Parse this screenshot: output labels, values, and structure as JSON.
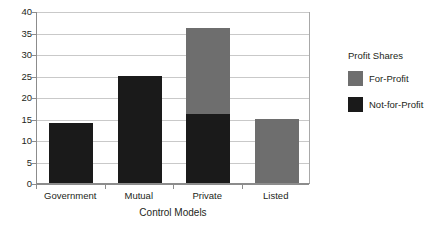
{
  "chart_data": {
    "type": "bar",
    "subtype": "stacked-column",
    "title": "",
    "xlabel": "Control Models",
    "ylabel": "",
    "categories": [
      "Government",
      "Mutual",
      "Private",
      "Listed"
    ],
    "series": [
      {
        "name": "Not-for-Profit",
        "color": "#1a1a1a",
        "values": [
          14,
          25,
          16,
          0
        ]
      },
      {
        "name": "For-Profit",
        "color": "#6e6e6e",
        "values": [
          0,
          0,
          20,
          15
        ]
      }
    ],
    "totals": [
      14,
      25,
      36,
      15
    ],
    "ylim": [
      0,
      40
    ],
    "ytick_step": 5,
    "yticks": [
      0,
      5,
      10,
      15,
      20,
      25,
      30,
      35,
      40
    ],
    "ytick_labels": [
      "0",
      "5",
      "10",
      "15",
      "20",
      "25",
      "30",
      "35",
      "40"
    ],
    "grid": true,
    "grid_axis": "y",
    "legend_position": "right",
    "legend_title": "Profit Shares",
    "legend_entries": [
      {
        "label": "For-Profit",
        "color": "#6e6e6e"
      },
      {
        "label": "Not-for-Profit",
        "color": "#1a1a1a"
      }
    ]
  },
  "colors": {
    "for_profit": "#6e6e6e",
    "not_for_profit": "#1a1a1a",
    "gridline": "#c9c9c9",
    "axis": "#8c8c8c",
    "text": "#231f20",
    "background": "#ffffff"
  }
}
